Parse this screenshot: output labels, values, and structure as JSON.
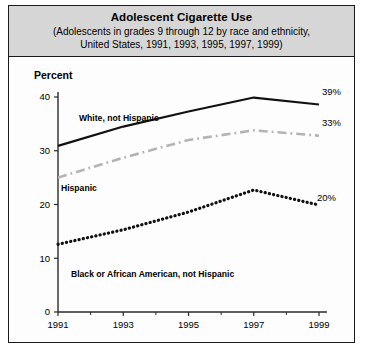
{
  "figure": {
    "title": "Adolescent Cigarette Use",
    "subtitle_line1": "(Adolescents in grades 9 through 12 by race and ethnicity,",
    "subtitle_line2": "United States, 1991, 1993, 1995, 1997, 1999)",
    "axis_label_y": "Percent"
  },
  "chart_data": {
    "type": "line",
    "title": "Adolescent Cigarette Use",
    "subtitle": "(Adolescents in grades 9 through 12 by race and ethnicity, United States, 1991, 1993, 1995, 1997, 1999)",
    "xlabel": "",
    "ylabel": "Percent",
    "xlim": [
      1991,
      1999
    ],
    "ylim": [
      0,
      40
    ],
    "ytick_labels": [
      "0",
      "10",
      "20",
      "30",
      "40"
    ],
    "yticks": [
      0,
      10,
      20,
      30,
      40
    ],
    "xtick_labels": [
      "1991",
      "1993",
      "1995",
      "1997",
      "1999"
    ],
    "xticks": [
      1991,
      1993,
      1995,
      1997,
      1999
    ],
    "minor_xticks": [
      1992,
      1994,
      1996,
      1998
    ],
    "grid": false,
    "legend_position": "inline-annotations",
    "x": [
      1991,
      1993,
      1995,
      1997,
      1999
    ],
    "series": [
      {
        "name": "White, not Hispanic",
        "label": "White, not Hispanic",
        "values": [
          30.9,
          34.5,
          37.3,
          39.9,
          38.6
        ],
        "end_label": "39%",
        "style": "solid",
        "color": "#111111"
      },
      {
        "name": "Hispanic",
        "label": "Hispanic",
        "values": [
          25.0,
          28.7,
          32.0,
          33.8,
          32.8
        ],
        "end_label": "33%",
        "style": "dash-dot",
        "color": "#b3b3b3"
      },
      {
        "name": "Black or African American, not Hispanic",
        "label": "Black or African American, not Hispanic",
        "values": [
          12.6,
          15.3,
          18.6,
          22.7,
          19.9
        ],
        "end_label": "20%",
        "style": "dotted",
        "color": "#111111"
      }
    ]
  }
}
